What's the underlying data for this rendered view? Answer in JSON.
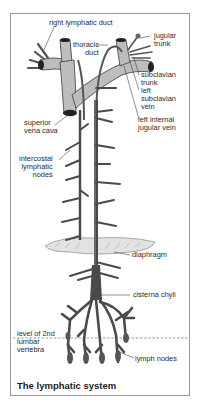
{
  "figure": {
    "caption": "The lymphatic system",
    "colors": {
      "vessel_fill": "#b9b9b9",
      "vessel_dark": "#4a4a4a",
      "vessel_outline": "#3a3a3a",
      "border": "#9a9a9a",
      "text": "#2a2a2a",
      "diaphragm_fill": "#e2e2e2"
    }
  },
  "labels": {
    "right_lymphatic_duct": "right lymphatic duct",
    "thoracic_duct": "thoracic\nduct",
    "jugular_trunk": "jugular\ntrunk",
    "subclavian_trunk": "subclavian\ntrunk",
    "left_subclavian_vein": "left\nsubclavian\nvein",
    "left_internal_jugular_vein": "left internal\njugular vein",
    "superior_vena_cava": "superior\nvena cava",
    "intercostal_lymphatic_nodes": "intercostal\nlymphatic\nnodes",
    "diaphragm": "diaphragm",
    "cisterna_chyli": "cisterna chyli",
    "level_of_2nd_lumbar_vertebra": "level of 2nd\nlumbar\nvertebra",
    "lymph_nodes": "lymph nodes"
  }
}
